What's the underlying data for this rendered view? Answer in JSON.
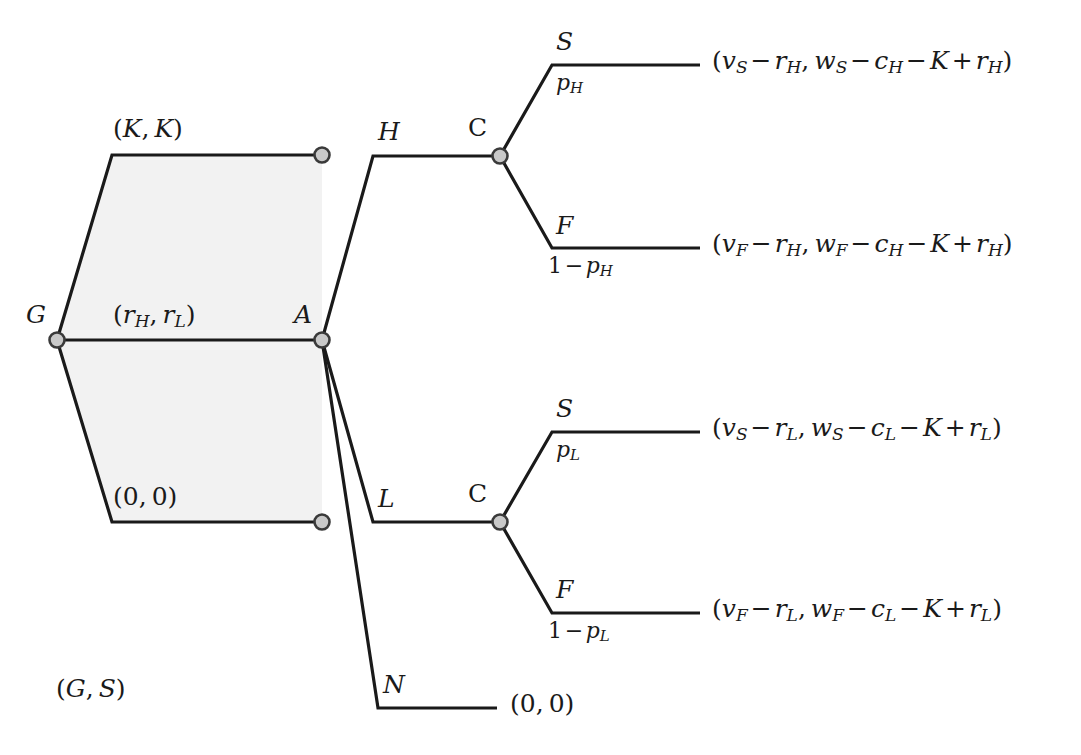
{
  "figure": {
    "type": "extensive-form-game-tree",
    "background_color": "#ffffff",
    "line_color": "#1a1a1a",
    "shaded_region_color": "#f2f2f2",
    "node_fill_color": "#c9c9c9",
    "node_stroke_color": "#3a3a3a"
  },
  "nodes": {
    "g": {
      "label": "G",
      "style": "italic"
    },
    "a": {
      "label": "A",
      "style": "italic"
    },
    "c_upper": {
      "label": "C",
      "style": "upright"
    },
    "c_lower": {
      "label": "C",
      "style": "upright"
    }
  },
  "edge_labels": {
    "h": "H",
    "l": "L",
    "n": "N",
    "s_upper": "S",
    "f_upper": "F",
    "s_lower": "S",
    "f_lower": "F"
  },
  "probabilities": {
    "p_upper_success": "p_H",
    "p_upper_fail": "1 - p_H",
    "p_lower_success": "p_L",
    "p_lower_fail": "1 - p_L"
  },
  "payoffs": {
    "g_offer_top": "(K, K)",
    "g_offer_middle": "(r_H, r_L)",
    "g_offer_bottom": "(0, 0)",
    "player_pair_caption": "(G, S)",
    "terminal_n": "(0, 0)",
    "terminal_sh": "(v_S - r_H, w_S - c_H - K + r_H)",
    "terminal_fh": "(v_F - r_H, w_F - c_H - K + r_H)",
    "terminal_sl": "(v_S - r_L, w_S - c_L - K + r_L)",
    "terminal_fl": "(v_F - r_L, w_F - c_L - K + r_L)"
  },
  "geometry": {
    "g_node": [
      57,
      340
    ],
    "a_node": [
      322,
      340
    ],
    "c_upper_node": [
      500,
      156
    ],
    "c_lower_node": [
      500,
      522
    ],
    "terminal_top": [
      322,
      155
    ],
    "terminal_bottom": [
      322,
      522
    ]
  }
}
